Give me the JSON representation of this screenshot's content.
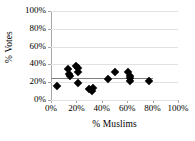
{
  "chart_data": {
    "type": "scatter",
    "title": "",
    "xlabel": "% Muslims",
    "ylabel": "% Votes",
    "xlim": [
      0,
      100
    ],
    "ylim": [
      0,
      100
    ],
    "grid": true,
    "legend": false,
    "xticks": [
      "0%",
      "20%",
      "40%",
      "60%",
      "80%",
      "100%"
    ],
    "xtick_values": [
      0,
      20,
      40,
      60,
      80,
      100
    ],
    "yticks": [
      "0%",
      "20%",
      "40%",
      "60%",
      "80%",
      "100%"
    ],
    "ytick_values": [
      0,
      20,
      40,
      60,
      80,
      100
    ],
    "marker": "diamond",
    "marker_color": "#000000",
    "series": [
      {
        "name": "Observations",
        "points": [
          [
            5,
            16
          ],
          [
            13,
            35
          ],
          [
            14,
            29
          ],
          [
            15,
            27
          ],
          [
            20,
            38
          ],
          [
            21,
            36
          ],
          [
            21,
            31
          ],
          [
            21,
            19
          ],
          [
            30,
            12
          ],
          [
            32,
            10
          ],
          [
            33,
            13
          ],
          [
            45,
            24
          ],
          [
            50,
            32
          ],
          [
            61,
            32
          ],
          [
            62,
            27
          ],
          [
            62,
            25
          ],
          [
            62,
            21
          ],
          [
            77,
            21
          ]
        ]
      }
    ],
    "trendline": {
      "name": "linear-fit",
      "color": "#808080",
      "x_start": 0,
      "y_start": 25,
      "x_end": 80,
      "y_end": 25
    }
  }
}
